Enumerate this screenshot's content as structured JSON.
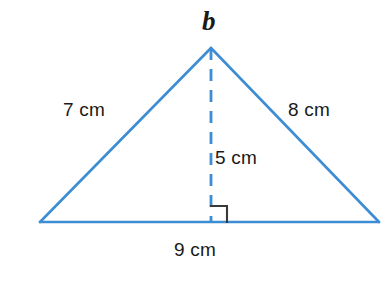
{
  "figure": {
    "type": "triangle-with-altitude",
    "stroke_color": "#3d8dd4",
    "text_color": "#1a1a1a",
    "right_angle_color": "#3a3a3a",
    "background_color": "#ffffff"
  },
  "labels": {
    "apex_vertex": "b",
    "left_side": "7 cm",
    "right_side": "8 cm",
    "altitude": "5 cm",
    "base": "9 cm"
  },
  "geometry": {
    "apex": {
      "x": 211,
      "y": 48
    },
    "base_left": {
      "x": 40,
      "y": 222
    },
    "base_right": {
      "x": 379,
      "y": 222
    },
    "foot_of_altitude": {
      "x": 211,
      "y": 222
    },
    "right_angle_marker": {
      "x": 211,
      "y": 222,
      "size": 16,
      "side": "right"
    },
    "altitude_dash": {
      "dash": 12,
      "gap": 9
    }
  },
  "measurements": {
    "side_left_cm": 7,
    "side_right_cm": 8,
    "base_cm": 9,
    "height_cm": 5,
    "units": "cm"
  }
}
